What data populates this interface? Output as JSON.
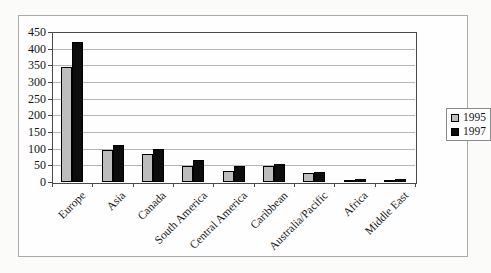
{
  "chart_data": {
    "type": "bar",
    "title": "",
    "xlabel": "",
    "ylabel": "",
    "categories": [
      "Europe",
      "Asia",
      "Canada",
      "South America",
      "Central America",
      "Caribbean",
      "Australia/Pacific",
      "Africa",
      "Middle East"
    ],
    "series": [
      {
        "name": "1995",
        "color": "#bdbdbd",
        "values": [
          345,
          95,
          85,
          48,
          33,
          47,
          27,
          6,
          5
        ]
      },
      {
        "name": "1997",
        "color": "#0d0d0d",
        "values": [
          420,
          110,
          100,
          67,
          48,
          55,
          30,
          10,
          8
        ]
      }
    ],
    "ylim": [
      0,
      450
    ],
    "yticks": [
      0,
      50,
      100,
      150,
      200,
      250,
      300,
      350,
      400,
      450
    ],
    "grid": true,
    "legend_position": "right",
    "colors": {
      "gridline": "#b6b6b6",
      "axis_border": "#4a4a4a",
      "frame_border": "#aaaaaa",
      "bar_outline": "#000000"
    }
  }
}
